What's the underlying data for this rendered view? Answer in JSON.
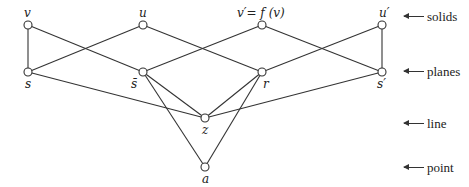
{
  "diagram": {
    "type": "hasse-diagram",
    "nodes": [
      {
        "id": "v",
        "label": "v",
        "x": 28,
        "y": 25,
        "level": "solids"
      },
      {
        "id": "u",
        "label": "u",
        "x": 143,
        "y": 25,
        "level": "solids"
      },
      {
        "id": "vp",
        "label": "v′= f (v)",
        "x": 262,
        "y": 25,
        "level": "solids"
      },
      {
        "id": "up",
        "label": "u′",
        "x": 382,
        "y": 25,
        "level": "solids"
      },
      {
        "id": "s",
        "label": "s",
        "x": 28,
        "y": 72,
        "level": "planes"
      },
      {
        "id": "sbar",
        "label": "s̄",
        "x": 143,
        "y": 72,
        "level": "planes"
      },
      {
        "id": "r",
        "label": "r",
        "x": 262,
        "y": 72,
        "level": "planes"
      },
      {
        "id": "sp",
        "label": "s′",
        "x": 382,
        "y": 72,
        "level": "planes"
      },
      {
        "id": "z",
        "label": "z",
        "x": 205,
        "y": 118,
        "level": "line"
      },
      {
        "id": "a",
        "label": "a",
        "x": 205,
        "y": 167,
        "level": "point"
      }
    ],
    "edges": [
      [
        "v",
        "s"
      ],
      [
        "v",
        "sbar"
      ],
      [
        "u",
        "s"
      ],
      [
        "u",
        "r"
      ],
      [
        "vp",
        "sbar"
      ],
      [
        "vp",
        "sp"
      ],
      [
        "up",
        "r"
      ],
      [
        "up",
        "sp"
      ],
      [
        "s",
        "z"
      ],
      [
        "sbar",
        "z"
      ],
      [
        "sbar",
        "a"
      ],
      [
        "r",
        "z"
      ],
      [
        "r",
        "a"
      ],
      [
        "sp",
        "z"
      ]
    ],
    "levels": [
      {
        "label": "solids",
        "y": 25
      },
      {
        "label": "planes",
        "y": 72
      },
      {
        "label": "line",
        "y": 124
      },
      {
        "label": "point",
        "y": 167
      }
    ]
  }
}
